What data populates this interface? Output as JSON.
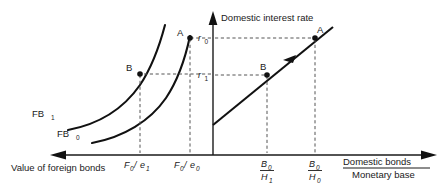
{
  "figure": {
    "background_color": "#ffffff",
    "line_color": "#111111",
    "dash_color": "#555555"
  },
  "axes": {
    "vertical": {
      "label": "Domestic interest rate",
      "name": "domestic-interest-rate-axis"
    },
    "left_horizontal": {
      "label": "Value of foreign bonds",
      "direction": "left",
      "name": "value-of-foreign-bonds-axis"
    },
    "right_horizontal": {
      "label_numerator": "Domestic bonds",
      "label_denominator": "Monetary base",
      "direction": "right",
      "name": "domestic-bonds-monetary-base-axis"
    }
  },
  "interest_ticks": [
    {
      "id": "r0",
      "base": "r",
      "sub": "0",
      "value_label": "r₀"
    },
    {
      "id": "r1",
      "base": "r",
      "sub": "1",
      "value_label": "r₁"
    }
  ],
  "left_panel": {
    "curves": [
      {
        "id": "FB1",
        "base": "FB",
        "sub": "1",
        "label": "FB₁"
      },
      {
        "id": "FB0",
        "base": "FB",
        "sub": "0",
        "label": "FB₀"
      }
    ],
    "points": [
      {
        "id": "A",
        "label": "A",
        "interest": "r0",
        "quantity": "F0/e0"
      },
      {
        "id": "B",
        "label": "B",
        "interest": "r1",
        "quantity": "F0/e1"
      }
    ],
    "ticks": [
      {
        "id": "F0e1",
        "numerator": "F",
        "num_sub": "0",
        "denominator": "e",
        "den_sub": "1",
        "label": "F₀/e₁"
      },
      {
        "id": "F0e0",
        "numerator": "F",
        "num_sub": "0",
        "denominator": "e",
        "den_sub": "0",
        "label": "F₀/e₀"
      }
    ]
  },
  "right_panel": {
    "schedule": {
      "id": "domestic-bond-schedule",
      "shape": "upward-sloping line",
      "arrow": "down-left"
    },
    "points": [
      {
        "id": "A",
        "label": "A",
        "interest": "r0",
        "quantity": "B0/H0"
      },
      {
        "id": "B",
        "label": "B",
        "interest": "r1",
        "quantity": "B0/H1"
      }
    ],
    "ticks": [
      {
        "id": "B0H1",
        "numerator": "B",
        "num_sub": "0",
        "denominator": "H",
        "den_sub": "1",
        "label": "B₀/H₁"
      },
      {
        "id": "B0H0",
        "numerator": "B",
        "num_sub": "0",
        "denominator": "H",
        "den_sub": "0",
        "label": "B₀/H₀"
      }
    ]
  }
}
